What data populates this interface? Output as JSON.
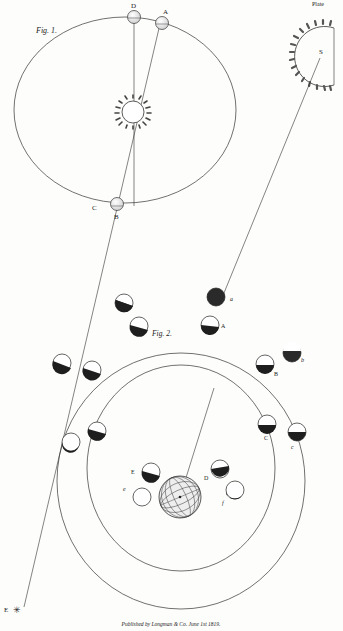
{
  "plate": {
    "corner_mark": "Plate",
    "caption": "Published by Longman & Co. June 1st 1819."
  },
  "fig1": {
    "title": "Fig. 1.",
    "labels": {
      "D": "D",
      "A": "A",
      "B": "B",
      "C": "C",
      "S": "S",
      "E": "E"
    },
    "star_glyph": "✳"
  },
  "fig2": {
    "title": "Fig. 2.",
    "outer_labels": [
      "a",
      "b",
      "c",
      "f",
      "e"
    ],
    "inner_labels": [
      "A",
      "B",
      "C",
      "D",
      "E"
    ]
  },
  "colors": {
    "ink": "#222222",
    "paper": "#fdfdfb",
    "shade": "#1e1e1e"
  }
}
